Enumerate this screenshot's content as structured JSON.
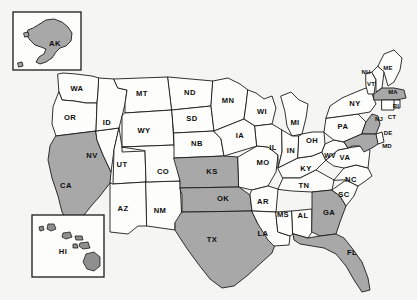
{
  "map": {
    "title": "United States choropleth map",
    "background_color": "#f5f5f3",
    "shaded_fill": "#a8a8a8",
    "unshaded_fill": "#fdfdfb",
    "border_color": "#1b1b1b",
    "shaded_count": 10,
    "unshaded_count": 40,
    "insets": [
      {
        "name": "alaska-inset",
        "label": "AK"
      },
      {
        "name": "hawaii-inset",
        "label": "HI"
      }
    ]
  },
  "chart_data": {
    "type": "choropleth",
    "xlabel": "",
    "ylabel": "",
    "legend": [],
    "categories": [
      "AK",
      "AL",
      "AR",
      "AZ",
      "CA",
      "CO",
      "CT",
      "DE",
      "FL",
      "GA",
      "HI",
      "IA",
      "ID",
      "IL",
      "IN",
      "KS",
      "KY",
      "LA",
      "MA",
      "MD",
      "ME",
      "MI",
      "MN",
      "MO",
      "MS",
      "MT",
      "NB",
      "NC",
      "ND",
      "NH",
      "NJ",
      "NM",
      "NV",
      "NY",
      "OH",
      "OK",
      "OR",
      "PA",
      "RI",
      "SC",
      "SD",
      "TN",
      "TX",
      "UT",
      "VA",
      "VT",
      "WA",
      "WI",
      "WV",
      "WY"
    ],
    "values": [
      1,
      0,
      0,
      0,
      1,
      0,
      0,
      0,
      1,
      1,
      0,
      0,
      0,
      0,
      0,
      1,
      0,
      0,
      1,
      1,
      0,
      0,
      0,
      0,
      0,
      0,
      0,
      0,
      0,
      0,
      1,
      0,
      0,
      0,
      0,
      1,
      0,
      0,
      0,
      0,
      0,
      0,
      1,
      0,
      0,
      0,
      0,
      0,
      0,
      0
    ],
    "value_labels": {
      "0": "not selected",
      "1": "selected"
    },
    "selected_states": [
      "AK",
      "CA",
      "KS",
      "OK",
      "TX",
      "GA",
      "FL",
      "MA",
      "NJ",
      "MD"
    ]
  },
  "states": [
    {
      "abbr": "WA",
      "x": 77,
      "y": 89,
      "size": "lg",
      "shaded": false
    },
    {
      "abbr": "OR",
      "x": 70,
      "y": 118,
      "size": "lg",
      "shaded": false
    },
    {
      "abbr": "CA",
      "x": 66,
      "y": 186,
      "size": "lg",
      "shaded": true
    },
    {
      "abbr": "NV",
      "x": 92,
      "y": 156,
      "size": "lg",
      "shaded": false
    },
    {
      "abbr": "ID",
      "x": 107,
      "y": 123,
      "size": "lg",
      "shaded": false
    },
    {
      "abbr": "MT",
      "x": 142,
      "y": 94,
      "size": "lg",
      "shaded": false
    },
    {
      "abbr": "WY",
      "x": 144,
      "y": 131,
      "size": "lg",
      "shaded": false
    },
    {
      "abbr": "UT",
      "x": 122,
      "y": 165,
      "size": "lg",
      "shaded": false
    },
    {
      "abbr": "AZ",
      "x": 123,
      "y": 209,
      "size": "lg",
      "shaded": false
    },
    {
      "abbr": "NM",
      "x": 160,
      "y": 211,
      "size": "lg",
      "shaded": false
    },
    {
      "abbr": "CO",
      "x": 163,
      "y": 172,
      "size": "lg",
      "shaded": false
    },
    {
      "abbr": "ND",
      "x": 190,
      "y": 93,
      "size": "lg",
      "shaded": false
    },
    {
      "abbr": "SD",
      "x": 192,
      "y": 119,
      "size": "lg",
      "shaded": false
    },
    {
      "abbr": "NB",
      "x": 197,
      "y": 144,
      "size": "lg",
      "shaded": false
    },
    {
      "abbr": "KS",
      "x": 212,
      "y": 172,
      "size": "lg",
      "shaded": true
    },
    {
      "abbr": "OK",
      "x": 223,
      "y": 199,
      "size": "lg",
      "shaded": true
    },
    {
      "abbr": "TX",
      "x": 212,
      "y": 240,
      "size": "lg",
      "shaded": true
    },
    {
      "abbr": "MN",
      "x": 228,
      "y": 101,
      "size": "lg",
      "shaded": false
    },
    {
      "abbr": "IA",
      "x": 240,
      "y": 136,
      "size": "lg",
      "shaded": false
    },
    {
      "abbr": "MO",
      "x": 263,
      "y": 163,
      "size": "lg",
      "shaded": false
    },
    {
      "abbr": "AR",
      "x": 263,
      "y": 202,
      "size": "lg",
      "shaded": false
    },
    {
      "abbr": "LA",
      "x": 263,
      "y": 234,
      "size": "lg",
      "shaded": false
    },
    {
      "abbr": "WI",
      "x": 262,
      "y": 112,
      "size": "lg",
      "shaded": false
    },
    {
      "abbr": "IL",
      "x": 273,
      "y": 148,
      "size": "lg",
      "shaded": false
    },
    {
      "abbr": "MS",
      "x": 283,
      "y": 215,
      "size": "lg",
      "shaded": false
    },
    {
      "abbr": "MI",
      "x": 295,
      "y": 123,
      "size": "lg",
      "shaded": false
    },
    {
      "abbr": "IN",
      "x": 291,
      "y": 151,
      "size": "lg",
      "shaded": false
    },
    {
      "abbr": "AL",
      "x": 303,
      "y": 216,
      "size": "lg",
      "shaded": false
    },
    {
      "abbr": "KY",
      "x": 306,
      "y": 169,
      "size": "lg",
      "shaded": false
    },
    {
      "abbr": "TN",
      "x": 304,
      "y": 186,
      "size": "lg",
      "shaded": false
    },
    {
      "abbr": "OH",
      "x": 312,
      "y": 141,
      "size": "lg",
      "shaded": false
    },
    {
      "abbr": "GA",
      "x": 329,
      "y": 213,
      "size": "lg",
      "shaded": true
    },
    {
      "abbr": "FL",
      "x": 352,
      "y": 253,
      "size": "lg",
      "shaded": true
    },
    {
      "abbr": "SC",
      "x": 344,
      "y": 195,
      "size": "lg",
      "shaded": false
    },
    {
      "abbr": "NC",
      "x": 351,
      "y": 180,
      "size": "lg",
      "shaded": false
    },
    {
      "abbr": "VA",
      "x": 345,
      "y": 158,
      "size": "lg",
      "shaded": false
    },
    {
      "abbr": "WV",
      "x": 330,
      "y": 156,
      "size": "md",
      "shaded": false
    },
    {
      "abbr": "PA",
      "x": 343,
      "y": 127,
      "size": "lg",
      "shaded": false
    },
    {
      "abbr": "NY",
      "x": 355,
      "y": 104,
      "size": "lg",
      "shaded": false
    },
    {
      "abbr": "VT",
      "x": 371,
      "y": 84,
      "size": "sm",
      "shaded": false
    },
    {
      "abbr": "NH",
      "x": 366,
      "y": 72,
      "size": "sm",
      "shaded": false
    },
    {
      "abbr": "ME",
      "x": 388,
      "y": 68,
      "size": "sm",
      "shaded": false
    },
    {
      "abbr": "MA",
      "x": 393,
      "y": 92,
      "size": "sm",
      "shaded": true
    },
    {
      "abbr": "RI",
      "x": 396,
      "y": 106,
      "size": "sm",
      "shaded": false
    },
    {
      "abbr": "CT",
      "x": 392,
      "y": 117,
      "size": "sm",
      "shaded": false
    },
    {
      "abbr": "NJ",
      "x": 379,
      "y": 119,
      "size": "sm",
      "shaded": true
    },
    {
      "abbr": "DE",
      "x": 388,
      "y": 133,
      "size": "sm",
      "shaded": false
    },
    {
      "abbr": "MD",
      "x": 387,
      "y": 146,
      "size": "sm",
      "shaded": true
    },
    {
      "abbr": "AK",
      "x": 55,
      "y": 44,
      "size": "lg",
      "shaded": true
    },
    {
      "abbr": "HI",
      "x": 63,
      "y": 252,
      "size": "lg",
      "shaded": false
    }
  ]
}
